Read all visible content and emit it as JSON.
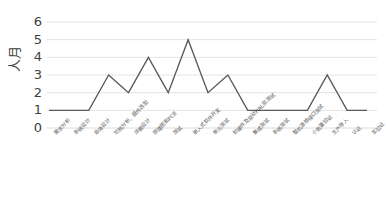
{
  "chart_data": {
    "type": "line",
    "title": "",
    "xlabel": "",
    "ylabel": "人月",
    "ylim": [
      0,
      6
    ],
    "yticks": [
      0,
      1,
      2,
      3,
      4,
      5,
      6
    ],
    "grid": true,
    "legend": "none",
    "line_color": "#595959",
    "categories": [
      "需求分析",
      "系统设计",
      "总体设计",
      "功耗分析、器件选型",
      "详细设计",
      "原理图和PCB",
      "测试",
      "嵌入式软件开发",
      "单元测试",
      "软硬件及驱动HAL层测试",
      "集成测试",
      "系统测试",
      "整机游移接口测试",
      "小批量验证",
      "生产导入",
      "认证",
      "实验证"
    ],
    "values": [
      1,
      1,
      1,
      3,
      2,
      4,
      2,
      5,
      2,
      3,
      1,
      1,
      1,
      1,
      3,
      1,
      1
    ]
  }
}
